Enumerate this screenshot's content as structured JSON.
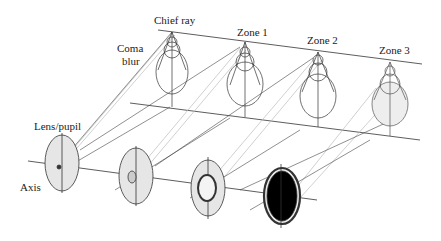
{
  "diagram": {
    "labels": {
      "chief_ray": "Chief ray",
      "coma_blur_1": "Coma",
      "coma_blur_2": "blur",
      "zone1": "Zone 1",
      "zone2": "Zone 2",
      "zone3": "Zone 3",
      "lens_pupil": "Lens/pupil",
      "axis": "Axis"
    },
    "colors": {
      "line": "#333333",
      "lens_fill": "#e6e6e6",
      "beam": "#bbbbbb"
    }
  }
}
